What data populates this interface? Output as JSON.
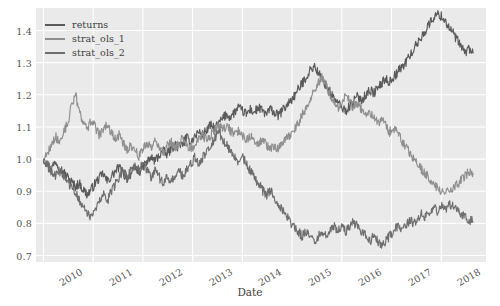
{
  "chart_data": {
    "type": "line",
    "title": "",
    "xlabel": "Date",
    "ylabel": "",
    "grid": true,
    "legend_position": "upper left",
    "xlim": [
      2009.85,
      2018.9
    ],
    "ylim": [
      0.68,
      1.47
    ],
    "yticks": [
      "1.4",
      "1.3",
      "1.2",
      "1.1",
      "1.0",
      "0.9",
      "0.8",
      "0.7"
    ],
    "ytick_values": [
      1.4,
      1.3,
      1.2,
      1.1,
      1.0,
      0.9,
      0.8,
      0.7
    ],
    "xticks": [
      "2010",
      "2011",
      "2012",
      "2013",
      "2014",
      "2015",
      "2016",
      "2017",
      "2018"
    ],
    "xtick_values": [
      2010,
      2011,
      2012,
      2013,
      2014,
      2015,
      2016,
      2017,
      2018
    ],
    "xtick_rotation": -30,
    "colors": {
      "panel_background": "#eaeaea",
      "gridline": "#ffffff",
      "returns": "#5a5a5a",
      "strat_ols_1": "#8f8f8f",
      "strat_ols_2": "#6e6e6e",
      "tick_label": "#555555",
      "axis_label": "#3f3f3f"
    },
    "series": [
      {
        "name": "returns",
        "color": "#5a5a5a",
        "x": [
          2010.0,
          2010.08,
          2010.16,
          2010.24,
          2010.32,
          2010.4,
          2010.48,
          2010.56,
          2010.64,
          2010.72,
          2010.8,
          2010.88,
          2010.96,
          2011.04,
          2011.12,
          2011.2,
          2011.28,
          2011.36,
          2011.44,
          2011.52,
          2011.6,
          2011.68,
          2011.76,
          2011.84,
          2011.92,
          2012.0,
          2012.08,
          2012.16,
          2012.24,
          2012.32,
          2012.4,
          2012.48,
          2012.56,
          2012.64,
          2012.72,
          2012.8,
          2012.88,
          2012.96,
          2013.04,
          2013.12,
          2013.2,
          2013.28,
          2013.36,
          2013.44,
          2013.52,
          2013.6,
          2013.68,
          2013.76,
          2013.84,
          2013.92,
          2014.0,
          2014.08,
          2014.16,
          2014.24,
          2014.32,
          2014.4,
          2014.48,
          2014.56,
          2014.64,
          2014.72,
          2014.8,
          2014.88,
          2014.96,
          2015.04,
          2015.12,
          2015.2,
          2015.28,
          2015.36,
          2015.44,
          2015.52,
          2015.6,
          2015.68,
          2015.76,
          2015.84,
          2015.92,
          2016.0,
          2016.08,
          2016.16,
          2016.24,
          2016.32,
          2016.4,
          2016.48,
          2016.56,
          2016.64,
          2016.72,
          2016.8,
          2016.88,
          2016.96,
          2017.04,
          2017.12,
          2017.2,
          2017.28,
          2017.36,
          2017.44,
          2017.52,
          2017.6,
          2017.68,
          2017.76,
          2017.84,
          2017.92,
          2018.0,
          2018.08,
          2018.16,
          2018.24,
          2018.32,
          2018.4,
          2018.48,
          2018.56,
          2018.64
        ],
        "y": [
          1.0,
          0.985,
          0.97,
          0.995,
          0.975,
          0.96,
          0.945,
          0.93,
          0.915,
          0.925,
          0.905,
          0.89,
          0.905,
          0.925,
          0.94,
          0.955,
          0.93,
          0.945,
          0.96,
          0.975,
          0.955,
          0.94,
          0.955,
          0.97,
          0.96,
          0.975,
          0.99,
          1.005,
          0.995,
          1.01,
          1.025,
          1.015,
          1.03,
          1.045,
          1.035,
          1.05,
          1.065,
          1.055,
          1.07,
          1.085,
          1.075,
          1.09,
          1.105,
          1.095,
          1.11,
          1.125,
          1.14,
          1.13,
          1.145,
          1.16,
          1.15,
          1.14,
          1.155,
          1.145,
          1.16,
          1.15,
          1.14,
          1.155,
          1.145,
          1.135,
          1.15,
          1.165,
          1.18,
          1.195,
          1.215,
          1.235,
          1.255,
          1.275,
          1.29,
          1.27,
          1.25,
          1.23,
          1.21,
          1.19,
          1.175,
          1.16,
          1.15,
          1.165,
          1.18,
          1.195,
          1.185,
          1.2,
          1.215,
          1.205,
          1.22,
          1.235,
          1.25,
          1.24,
          1.255,
          1.27,
          1.285,
          1.3,
          1.32,
          1.34,
          1.36,
          1.38,
          1.4,
          1.42,
          1.44,
          1.45,
          1.445,
          1.43,
          1.41,
          1.39,
          1.37,
          1.35,
          1.33,
          1.345,
          1.33
        ]
      },
      {
        "name": "strat_ols_1",
        "color": "#8f8f8f",
        "x": [
          2010.0,
          2010.08,
          2010.16,
          2010.24,
          2010.32,
          2010.4,
          2010.48,
          2010.56,
          2010.64,
          2010.72,
          2010.8,
          2010.88,
          2010.96,
          2011.04,
          2011.12,
          2011.2,
          2011.28,
          2011.36,
          2011.44,
          2011.52,
          2011.6,
          2011.68,
          2011.76,
          2011.84,
          2011.92,
          2012.0,
          2012.08,
          2012.16,
          2012.24,
          2012.32,
          2012.4,
          2012.48,
          2012.56,
          2012.64,
          2012.72,
          2012.8,
          2012.88,
          2012.96,
          2013.04,
          2013.12,
          2013.2,
          2013.28,
          2013.36,
          2013.44,
          2013.52,
          2013.6,
          2013.68,
          2013.76,
          2013.84,
          2013.92,
          2014.0,
          2014.08,
          2014.16,
          2014.24,
          2014.32,
          2014.4,
          2014.48,
          2014.56,
          2014.64,
          2014.72,
          2014.8,
          2014.88,
          2014.96,
          2015.04,
          2015.12,
          2015.2,
          2015.28,
          2015.36,
          2015.44,
          2015.52,
          2015.6,
          2015.68,
          2015.76,
          2015.84,
          2015.92,
          2016.0,
          2016.08,
          2016.16,
          2016.24,
          2016.32,
          2016.4,
          2016.48,
          2016.56,
          2016.64,
          2016.72,
          2016.8,
          2016.88,
          2016.96,
          2017.04,
          2017.12,
          2017.2,
          2017.28,
          2017.36,
          2017.44,
          2017.52,
          2017.6,
          2017.68,
          2017.76,
          2017.84,
          2017.92,
          2018.0,
          2018.08,
          2018.16,
          2018.24,
          2018.32,
          2018.4,
          2018.48,
          2018.56,
          2018.64
        ],
        "y": [
          1.0,
          1.02,
          1.045,
          1.07,
          1.055,
          1.08,
          1.11,
          1.16,
          1.205,
          1.15,
          1.115,
          1.095,
          1.12,
          1.1,
          1.075,
          1.09,
          1.11,
          1.085,
          1.06,
          1.075,
          1.05,
          1.03,
          1.045,
          1.025,
          1.01,
          1.03,
          1.05,
          1.035,
          1.055,
          1.04,
          1.02,
          1.04,
          1.055,
          1.035,
          1.05,
          1.065,
          1.045,
          1.03,
          1.045,
          1.06,
          1.075,
          1.06,
          1.075,
          1.09,
          1.105,
          1.09,
          1.105,
          1.09,
          1.075,
          1.09,
          1.075,
          1.06,
          1.075,
          1.06,
          1.045,
          1.06,
          1.045,
          1.03,
          1.045,
          1.03,
          1.045,
          1.06,
          1.075,
          1.09,
          1.11,
          1.135,
          1.16,
          1.185,
          1.21,
          1.235,
          1.255,
          1.23,
          1.205,
          1.18,
          1.16,
          1.18,
          1.2,
          1.18,
          1.16,
          1.175,
          1.155,
          1.135,
          1.15,
          1.13,
          1.11,
          1.125,
          1.105,
          1.085,
          1.1,
          1.08,
          1.06,
          1.04,
          1.02,
          1.0,
          0.985,
          0.97,
          0.955,
          0.94,
          0.925,
          0.91,
          0.895,
          0.905,
          0.89,
          0.905,
          0.92,
          0.935,
          0.95,
          0.96,
          0.955
        ]
      },
      {
        "name": "strat_ols_2",
        "color": "#6e6e6e",
        "x": [
          2010.0,
          2010.08,
          2010.16,
          2010.24,
          2010.32,
          2010.4,
          2010.48,
          2010.56,
          2010.64,
          2010.72,
          2010.8,
          2010.88,
          2010.96,
          2011.04,
          2011.12,
          2011.2,
          2011.28,
          2011.36,
          2011.44,
          2011.52,
          2011.6,
          2011.68,
          2011.76,
          2011.84,
          2011.92,
          2012.0,
          2012.08,
          2012.16,
          2012.24,
          2012.32,
          2012.4,
          2012.48,
          2012.56,
          2012.64,
          2012.72,
          2012.8,
          2012.88,
          2012.96,
          2013.04,
          2013.12,
          2013.2,
          2013.28,
          2013.36,
          2013.44,
          2013.52,
          2013.6,
          2013.68,
          2013.76,
          2013.84,
          2013.92,
          2014.0,
          2014.08,
          2014.16,
          2014.24,
          2014.32,
          2014.4,
          2014.48,
          2014.56,
          2014.64,
          2014.72,
          2014.8,
          2014.88,
          2014.96,
          2015.04,
          2015.12,
          2015.2,
          2015.28,
          2015.36,
          2015.44,
          2015.52,
          2015.6,
          2015.68,
          2015.76,
          2015.84,
          2015.92,
          2016.0,
          2016.08,
          2016.16,
          2016.24,
          2016.32,
          2016.4,
          2016.48,
          2016.56,
          2016.64,
          2016.72,
          2016.8,
          2016.88,
          2016.96,
          2017.04,
          2017.12,
          2017.2,
          2017.28,
          2017.36,
          2017.44,
          2017.52,
          2017.6,
          2017.68,
          2017.76,
          2017.84,
          2017.92,
          2018.0,
          2018.08,
          2018.16,
          2018.24,
          2018.32,
          2018.4,
          2018.48,
          2018.56,
          2018.64
        ],
        "y": [
          1.0,
          0.98,
          0.96,
          0.945,
          0.965,
          0.95,
          0.93,
          0.91,
          0.895,
          0.875,
          0.855,
          0.835,
          0.815,
          0.84,
          0.865,
          0.89,
          0.87,
          0.895,
          0.92,
          0.945,
          0.965,
          0.945,
          0.965,
          0.985,
          0.965,
          0.985,
          0.965,
          0.945,
          0.965,
          0.945,
          0.925,
          0.945,
          0.925,
          0.945,
          0.965,
          0.945,
          0.965,
          0.985,
          1.005,
          0.985,
          1.005,
          1.025,
          1.045,
          1.065,
          1.085,
          1.065,
          1.045,
          1.025,
          1.005,
          0.985,
          1.005,
          0.985,
          0.965,
          0.945,
          0.925,
          0.905,
          0.885,
          0.905,
          0.885,
          0.865,
          0.845,
          0.825,
          0.805,
          0.79,
          0.775,
          0.76,
          0.775,
          0.76,
          0.745,
          0.76,
          0.775,
          0.76,
          0.775,
          0.79,
          0.775,
          0.79,
          0.775,
          0.79,
          0.805,
          0.79,
          0.775,
          0.76,
          0.745,
          0.76,
          0.745,
          0.73,
          0.745,
          0.76,
          0.775,
          0.79,
          0.78,
          0.795,
          0.81,
          0.8,
          0.815,
          0.83,
          0.82,
          0.835,
          0.85,
          0.84,
          0.855,
          0.845,
          0.86,
          0.85,
          0.84,
          0.83,
          0.82,
          0.81,
          0.805
        ]
      }
    ]
  },
  "legend": {
    "items": [
      {
        "label": "returns"
      },
      {
        "label": "strat_ols_1"
      },
      {
        "label": "strat_ols_2"
      }
    ]
  },
  "axes": {
    "xlabel": "Date"
  }
}
